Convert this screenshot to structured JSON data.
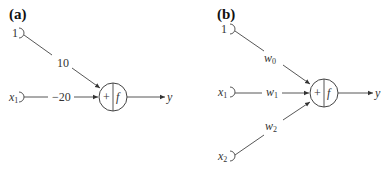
{
  "panels": [
    {
      "label": "(a)",
      "inputs": [
        {
          "name": "1",
          "sub": ""
        },
        {
          "name": "x",
          "sub": "1"
        }
      ],
      "weights": [
        {
          "text": "10",
          "sub": ""
        },
        {
          "text": "−20",
          "sub": ""
        }
      ],
      "node": {
        "sum": "+",
        "activation": "f"
      },
      "output": "y"
    },
    {
      "label": "(b)",
      "inputs": [
        {
          "name": "1",
          "sub": ""
        },
        {
          "name": "x",
          "sub": "1"
        },
        {
          "name": "x",
          "sub": "2"
        }
      ],
      "weights": [
        {
          "text": "w",
          "sub": "0"
        },
        {
          "text": "w",
          "sub": "1"
        },
        {
          "text": "w",
          "sub": "2"
        }
      ],
      "node": {
        "sum": "+",
        "activation": "f"
      },
      "output": "y"
    }
  ]
}
